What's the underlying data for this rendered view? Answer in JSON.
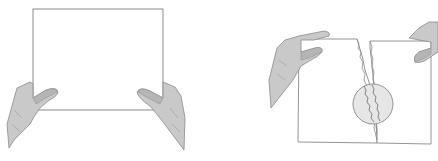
{
  "figure": {
    "panels": [
      {
        "id": "left",
        "description": "Two hands holding a blank sheet of paper"
      },
      {
        "id": "right",
        "description": "Two hands tearing the sheet of paper, with a magnified circle showing the jagged tear"
      }
    ],
    "colors": {
      "background": "#ffffff",
      "line": "#8a8a8a",
      "hand_fill": "#c9c9c9",
      "hand_shade": "#a9a9a9",
      "magnifier_fill": "#e6e6e6"
    }
  }
}
